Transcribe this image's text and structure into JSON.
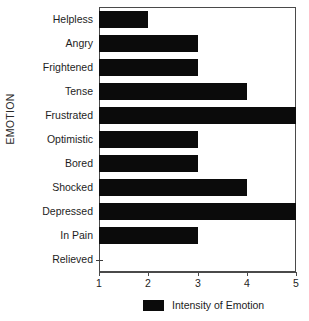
{
  "chart_data": {
    "type": "bar",
    "orientation": "horizontal",
    "title": "",
    "xlabel": "",
    "ylabel": "EMOTION",
    "categories": [
      "Helpless",
      "Angry",
      "Frightened",
      "Tense",
      "Frustrated",
      "Optimistic",
      "Bored",
      "Shocked",
      "Depressed",
      "In Pain",
      "Relieved"
    ],
    "values": [
      2,
      3,
      3,
      4,
      5,
      3,
      3,
      4,
      5,
      3,
      1
    ],
    "series": [
      {
        "name": "Intensity of Emotion",
        "values": [
          2,
          3,
          3,
          4,
          5,
          3,
          3,
          4,
          5,
          3,
          1
        ]
      }
    ],
    "xlim": [
      1,
      5
    ],
    "xticks": [
      1,
      2,
      3,
      4,
      5
    ],
    "xtick_labels": [
      "1",
      "2",
      "3",
      "4",
      "5"
    ],
    "bar_base": 1,
    "grid": false,
    "legend": {
      "position": "bottom-center",
      "entries": [
        {
          "label": "Intensity of Emotion",
          "color": "#0b0b0b"
        }
      ]
    },
    "colors": {
      "bar": "#0b0b0b",
      "axis": "#4a4a4a",
      "text": "#1d1d1d",
      "background": "#ffffff"
    }
  }
}
